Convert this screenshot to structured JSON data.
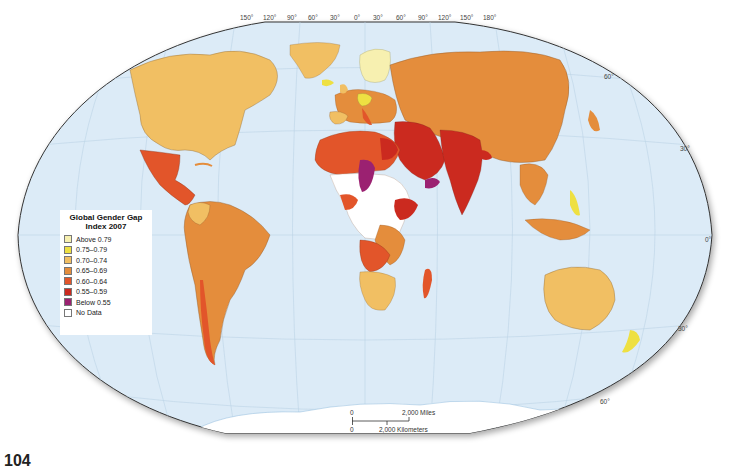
{
  "map": {
    "title": "Global Gender Gap Index 2007",
    "projection": "Winkel-style world map",
    "ocean_color": "#dcebf7",
    "outline_color": "#333333"
  },
  "legend": {
    "title_line1": "Global Gender Gap",
    "title_line2": "Index 2007",
    "items": [
      {
        "label": "Above 0.79",
        "color": "#f7f0b0"
      },
      {
        "label": "0.75–0.79",
        "color": "#eee042"
      },
      {
        "label": "0.70–0.74",
        "color": "#f1bf63"
      },
      {
        "label": "0.65–0.69",
        "color": "#e48d3c"
      },
      {
        "label": "0.60–0.64",
        "color": "#e2552a"
      },
      {
        "label": "0.55–0.59",
        "color": "#cb2a1f"
      },
      {
        "label": "Below 0.55",
        "color": "#9b2171"
      },
      {
        "label": "No Data",
        "color": "#ffffff"
      }
    ]
  },
  "longitude_labels": [
    "150°",
    "120°",
    "90°",
    "60°",
    "30°",
    "0°",
    "30°",
    "60°",
    "90°",
    "120°",
    "150°",
    "180°"
  ],
  "latitude_labels": {
    "right": [
      "60°",
      "30°",
      "0°",
      "30°",
      "60°"
    ]
  },
  "scale": {
    "miles_zero": "0",
    "miles_label": "2,000 Miles",
    "km_zero": "0",
    "km_label": "2,000 Kilometers"
  },
  "page_number": "104",
  "regions": {
    "north_america": {
      "value_class": "0.70–0.74"
    },
    "mexico_central_america": {
      "value_class": "0.60–0.64"
    },
    "south_america": {
      "value_class": "0.65–0.69"
    },
    "colombia": {
      "value_class": "0.70–0.74"
    },
    "chile": {
      "value_class": "0.60–0.64"
    },
    "greenland": {
      "value_class": "0.70–0.74"
    },
    "nordic": {
      "value_class": "Above 0.79"
    },
    "germany": {
      "value_class": "0.75–0.79"
    },
    "western_europe": {
      "value_class": "0.65–0.69"
    },
    "russia_china": {
      "value_class": "0.65–0.69"
    },
    "middle_east": {
      "value_class": "0.55–0.59"
    },
    "south_asia": {
      "value_class": "0.55–0.59"
    },
    "yemen_chad": {
      "value_class": "Below 0.55"
    },
    "north_africa": {
      "value_class": "0.60–0.64"
    },
    "southern_africa": {
      "value_class": "0.70–0.74"
    },
    "southeast_asia": {
      "value_class": "0.65–0.69"
    },
    "philippines": {
      "value_class": "0.75–0.79"
    },
    "australia": {
      "value_class": "0.70–0.74"
    },
    "new_zealand": {
      "value_class": "0.75–0.79"
    },
    "antarctica": {
      "value_class": "No Data"
    }
  }
}
